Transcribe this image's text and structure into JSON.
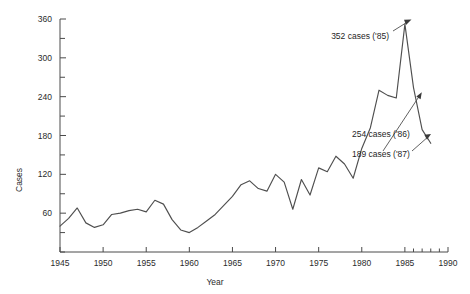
{
  "chart_data": {
    "type": "line",
    "title": "",
    "xlabel": "Year",
    "ylabel": "Cases",
    "xlim": [
      1945,
      1990
    ],
    "ylim": [
      0,
      360
    ],
    "grid": false,
    "legend": "none",
    "x_ticks": [
      1945,
      1950,
      1955,
      1960,
      1965,
      1970,
      1975,
      1980,
      1985,
      1990
    ],
    "x_tick_labels": [
      "1945",
      "1950",
      "1955",
      "1960",
      "1965",
      "1970",
      "1975",
      "1980",
      "1985",
      "1990"
    ],
    "x_minor_ticks": [
      1986,
      1987,
      1988,
      1989
    ],
    "y_ticks": [
      0,
      30,
      60,
      90,
      120,
      150,
      180,
      210,
      240,
      270,
      300,
      330,
      360
    ],
    "y_tick_labels": [
      "",
      "",
      "60",
      "",
      "120",
      "",
      "180",
      "",
      "240",
      "",
      "300",
      "",
      "360"
    ],
    "y_labeled_ticks": [
      60,
      120,
      180,
      240,
      300,
      360
    ],
    "series": [
      {
        "name": "Cases",
        "x": [
          1945,
          1946,
          1947,
          1948,
          1949,
          1950,
          1951,
          1952,
          1953,
          1954,
          1955,
          1956,
          1957,
          1958,
          1959,
          1960,
          1961,
          1962,
          1963,
          1964,
          1965,
          1966,
          1967,
          1968,
          1969,
          1970,
          1971,
          1972,
          1973,
          1974,
          1975,
          1976,
          1977,
          1978,
          1979,
          1980,
          1981,
          1982,
          1983,
          1984,
          1985,
          1986,
          1987,
          1988
        ],
        "values": [
          40,
          52,
          68,
          45,
          38,
          42,
          58,
          60,
          64,
          66,
          62,
          80,
          74,
          50,
          34,
          30,
          38,
          48,
          58,
          72,
          86,
          104,
          110,
          98,
          94,
          120,
          108,
          66,
          112,
          88,
          130,
          124,
          148,
          136,
          114,
          160,
          192,
          250,
          242,
          238,
          352,
          254,
          189,
          168
        ]
      }
    ],
    "annotations": [
      {
        "label": "352 cases ('85)",
        "year": 1985,
        "value": 352
      },
      {
        "label": "254 cases ('86)",
        "year": 1986,
        "value": 254
      },
      {
        "label": "189 cases ('87)",
        "year": 1987,
        "value": 189
      }
    ]
  }
}
